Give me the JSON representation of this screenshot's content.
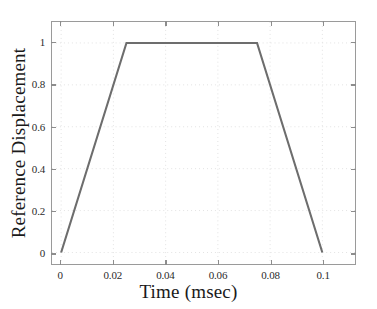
{
  "chart_data": {
    "type": "line",
    "title": "",
    "xlabel": "Time (msec)",
    "ylabel": "Reference Displacement",
    "xlim": [
      -0.0035,
      0.1125
    ],
    "ylim": [
      -0.055,
      1.1
    ],
    "xticks": [
      0,
      0.02,
      0.04,
      0.06,
      0.08,
      0.1
    ],
    "xtick_labels": [
      "0",
      "0.02",
      "0.04",
      "0.06",
      "0.08",
      "0.1"
    ],
    "yticks": [
      0,
      0.2,
      0.4,
      0.6,
      0.8,
      1
    ],
    "ytick_labels": [
      "0",
      "0.2",
      "0.4",
      "0.6",
      "0.8",
      "1"
    ],
    "grid": true,
    "grid_style": "dotted",
    "legend": "none",
    "line_color": "#6d6d6d",
    "line_width": 2.1,
    "series": [
      {
        "name": "Reference Displacement",
        "x": [
          0,
          0.025,
          0.075,
          0.1
        ],
        "values": [
          0,
          1,
          1,
          0
        ]
      }
    ],
    "annotations": []
  },
  "colors": {
    "axis": "#9a9a9a",
    "grid": "#e2e2e2",
    "text": "#1a1a1a",
    "tick_text": "#2b2b2b",
    "background": "#ffffff"
  }
}
